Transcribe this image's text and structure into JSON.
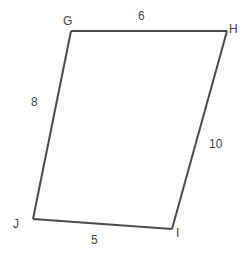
{
  "diagram": {
    "type": "quadrilateral",
    "colors": {
      "stroke": "#4a4a4a",
      "label": "#444444",
      "background": "#ffffff"
    },
    "vertices": [
      {
        "id": "G",
        "label": "G",
        "x": 71,
        "y": 31,
        "label_x": 63,
        "label_y": 25
      },
      {
        "id": "H",
        "label": "H",
        "x": 227,
        "y": 31,
        "label_x": 229,
        "label_y": 33
      },
      {
        "id": "I",
        "label": "I",
        "x": 172,
        "y": 229,
        "label_x": 176,
        "label_y": 237
      },
      {
        "id": "J",
        "label": "J",
        "x": 33,
        "y": 219,
        "label_x": 13,
        "label_y": 228
      }
    ],
    "sides": [
      {
        "from": "G",
        "to": "H",
        "length_label": "6",
        "label_x": 138,
        "label_y": 20
      },
      {
        "from": "G",
        "to": "J",
        "length_label": "8",
        "label_x": 31,
        "label_y": 106
      },
      {
        "from": "H",
        "to": "I",
        "length_label": "10",
        "label_x": 209,
        "label_y": 148
      },
      {
        "from": "J",
        "to": "I",
        "length_label": "5",
        "label_x": 91,
        "label_y": 244
      }
    ]
  }
}
